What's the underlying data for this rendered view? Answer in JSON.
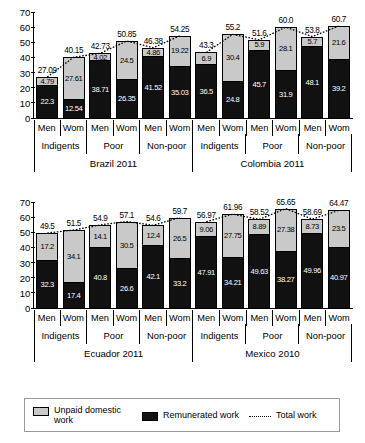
{
  "chart_data": [
    {
      "type": "bar",
      "subtype": "stacked-bar-with-total-line",
      "title": "",
      "xlabel": "",
      "ylabel": "",
      "ylim": [
        0,
        70
      ],
      "yticks": [
        0,
        10,
        20,
        30,
        40,
        50,
        60,
        70
      ],
      "grid": false,
      "panel_name": "top-panel",
      "countries": [
        "Brazil 2011",
        "Colombia 2011"
      ],
      "groups": [
        "Indigents",
        "Poor",
        "Non-poor"
      ],
      "sexes": [
        "Men",
        "Wom"
      ],
      "categories": [
        "Brazil 2011 / Indigents / Men",
        "Brazil 2011 / Indigents / Wom",
        "Brazil 2011 / Poor / Men",
        "Brazil 2011 / Poor / Wom",
        "Brazil 2011 / Non-poor / Men",
        "Brazil 2011 / Non-poor / Wom",
        "Colombia 2011 / Indigents / Men",
        "Colombia 2011 / Indigents / Wom",
        "Colombia 2011 / Poor / Men",
        "Colombia 2011 / Poor / Wom",
        "Colombia 2011 / Non-poor / Men",
        "Colombia 2011 / Non-poor / Wom"
      ],
      "series": [
        {
          "name": "Remunerated work",
          "color": "#111111",
          "values": [
            22.3,
            12.54,
            38.71,
            26.35,
            41.52,
            35.03,
            36.5,
            24.8,
            45.7,
            31.9,
            48.1,
            39.2
          ],
          "labels": [
            "22.3",
            "12.54",
            "38.71",
            "26.35",
            "41.52",
            "35.03",
            "36.5",
            "24.8",
            "45.7",
            "31.9",
            "48.1",
            "39.2"
          ]
        },
        {
          "name": "Unpaid domestic work",
          "color": "#c9c9c9",
          "values": [
            4.79,
            27.61,
            4.02,
            24.5,
            4.86,
            19.22,
            6.9,
            30.4,
            5.9,
            28.1,
            5.7,
            21.6
          ],
          "labels": [
            "4.79",
            "27.61",
            "4.02",
            "24.5",
            "4.86",
            "19.22",
            "6.9",
            "30.4",
            "5.9",
            "28.1",
            "5.7",
            "21.6"
          ]
        },
        {
          "name": "Total work",
          "color": "#000000",
          "style": "dotted",
          "values": [
            27.09,
            40.15,
            42.73,
            50.85,
            46.38,
            54.25,
            43.3,
            55.2,
            51.6,
            60.0,
            53.8,
            60.7
          ],
          "labels": [
            "27.09",
            "40.15",
            "42.73",
            "50.85",
            "46.38",
            "54.25",
            "43.3",
            "55.2",
            "51.6",
            "60.0",
            "53.8",
            "60.7"
          ]
        }
      ]
    },
    {
      "type": "bar",
      "subtype": "stacked-bar-with-total-line",
      "title": "",
      "xlabel": "",
      "ylabel": "",
      "ylim": [
        0,
        70
      ],
      "yticks": [
        0,
        10,
        20,
        30,
        40,
        50,
        60,
        70
      ],
      "grid": false,
      "panel_name": "bottom-panel",
      "countries": [
        "Ecuador 2011",
        "Mexico 2010"
      ],
      "groups": [
        "Indigents",
        "Poor",
        "Non-poor"
      ],
      "sexes": [
        "Men",
        "Wom"
      ],
      "categories": [
        "Ecuador 2011 / Indigents / Men",
        "Ecuador 2011 / Indigents / Wom",
        "Ecuador 2011 / Poor / Men",
        "Ecuador 2011 / Poor / Wom",
        "Ecuador 2011 / Non-poor / Men",
        "Ecuador 2011 / Non-poor / Wom",
        "Mexico 2010 / Indigents / Men",
        "Mexico 2010 / Indigents / Wom",
        "Mexico 2010 / Poor / Men",
        "Mexico 2010 / Poor / Wom",
        "Mexico 2010 / Non-poor / Men",
        "Mexico 2010 / Non-poor / Wom"
      ],
      "series": [
        {
          "name": "Remunerated work",
          "color": "#111111",
          "values": [
            32.3,
            17.4,
            40.8,
            26.6,
            42.1,
            33.2,
            47.91,
            34.21,
            49.63,
            38.27,
            49.96,
            40.97
          ],
          "labels": [
            "32.3",
            "17.4",
            "40.8",
            "26.6",
            "42.1",
            "33.2",
            "47.91",
            "34.21",
            "49.63",
            "38.27",
            "49.96",
            "40.97"
          ]
        },
        {
          "name": "Unpaid domestic work",
          "color": "#c9c9c9",
          "values": [
            17.2,
            34.1,
            14.1,
            30.5,
            12.4,
            26.5,
            9.06,
            27.75,
            8.89,
            27.38,
            8.73,
            23.5
          ],
          "labels": [
            "17.2",
            "34.1",
            "14.1",
            "30.5",
            "12.4",
            "26.5",
            "9.06",
            "27.75",
            "8.89",
            "27.38",
            "8.73",
            "23.5"
          ]
        },
        {
          "name": "Total work",
          "color": "#000000",
          "style": "dotted",
          "values": [
            49.5,
            51.5,
            54.9,
            57.1,
            54.6,
            59.7,
            56.97,
            61.96,
            58.52,
            65.65,
            58.69,
            64.47
          ],
          "labels": [
            "49.5",
            "51.5",
            "54.9",
            "57.1",
            "54.6",
            "59.7",
            "56.97",
            "61.96",
            "58.52",
            "65.65",
            "58.69",
            "64.47"
          ]
        }
      ]
    }
  ],
  "legend": {
    "position": "bottom",
    "items": [
      {
        "label_line1": "Unpaid domestic",
        "label_line2": "work",
        "swatch": "unpaid-swatch"
      },
      {
        "label_line1": "Remunerated",
        "label_line2": "work",
        "swatch": "paid-swatch"
      },
      {
        "label_line1": "Total work",
        "label_line2": "",
        "swatch": "total-line-swatch"
      }
    ]
  }
}
